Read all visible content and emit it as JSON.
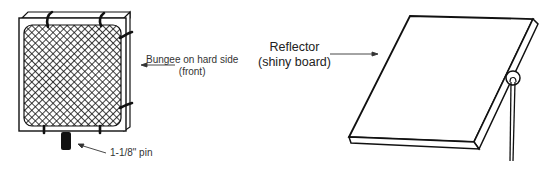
{
  "figure": {
    "left_panel": {
      "name": "Screen with mesh and bungee cords",
      "labels": {
        "bungee_line1": "Bungee on hard side",
        "bungee_line2": "(front)",
        "pin": "1-1/8\" pin"
      }
    },
    "right_panel": {
      "name": "Reflector board on stand",
      "labels": {
        "reflector_line1": "Reflector",
        "reflector_line2": "(shiny board)"
      }
    },
    "colors": {
      "ink": "#111111",
      "background": "#ffffff"
    }
  }
}
